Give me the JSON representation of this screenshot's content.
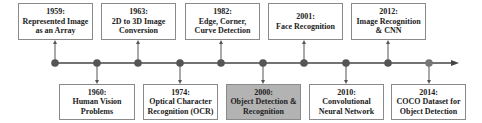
{
  "timeline": {
    "colors": {
      "line": "#444444",
      "dot": "#555555",
      "box_border": "#8a8a8a",
      "highlight_fill": "#b3b3b3"
    },
    "top_events": [
      {
        "year": "1959:",
        "lines": [
          "Represented Image",
          "as an Array"
        ]
      },
      {
        "year": "1963:",
        "lines": [
          "2D to 3D Image",
          "Conversion"
        ]
      },
      {
        "year": "1982:",
        "lines": [
          "Edge, Corner,",
          "Curve Detection"
        ]
      },
      {
        "year": "2001:",
        "lines": [
          "Face Recognition",
          ""
        ]
      },
      {
        "year": "2012:",
        "lines": [
          "Image Recognition",
          "& CNN"
        ]
      }
    ],
    "bottom_events": [
      {
        "year": "1960:",
        "lines": [
          "Human Vision",
          "Problems"
        ]
      },
      {
        "year": "1974:",
        "lines": [
          "Optical Character",
          "Recognition (OCR)"
        ]
      },
      {
        "year": "2000:",
        "lines": [
          "Object Detection &",
          "Recognition"
        ],
        "highlighted": true
      },
      {
        "year": "2010:",
        "lines": [
          "Convolutional",
          "Neural Network"
        ]
      },
      {
        "year": "2014:",
        "lines": [
          "COCO Dataset for",
          "Object Detection"
        ]
      }
    ]
  }
}
